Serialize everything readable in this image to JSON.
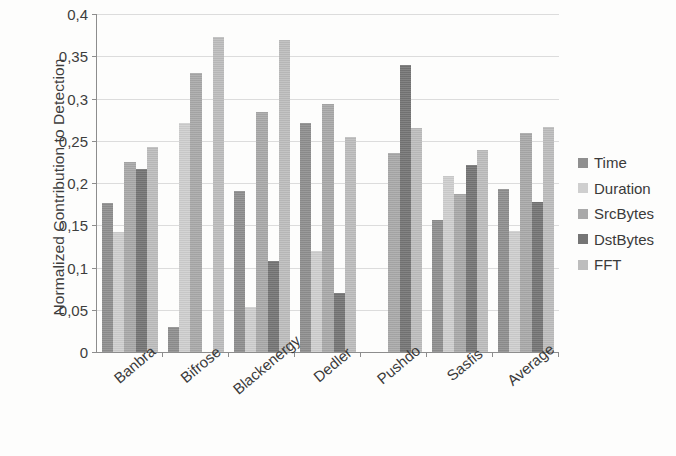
{
  "chart_data": {
    "type": "bar",
    "title": "",
    "xlabel": "",
    "ylabel": "Normalized Contribution to Detection",
    "ylim": [
      0,
      0.4
    ],
    "ytick_values": [
      0,
      0.05,
      0.1,
      0.15,
      0.2,
      0.25,
      0.3,
      0.35,
      0.4
    ],
    "ytick_labels": [
      "0",
      "0,05",
      "0,1",
      "0,15",
      "0,2",
      "0,25",
      "0,3",
      "0,35",
      "0,4"
    ],
    "grid": true,
    "legend_position": "right",
    "decimal_separator": ",",
    "categories": [
      "Banbra",
      "Bifrose",
      "Blackenergy",
      "Dedler",
      "Pushdo",
      "Sasfis",
      "Average"
    ],
    "series": [
      {
        "name": "Time",
        "color": "#8f8f8f",
        "values": [
          0.176,
          0.03,
          0.19,
          0.271,
          0.0,
          0.156,
          0.193
        ]
      },
      {
        "name": "Duration",
        "color": "#cfcfcf",
        "values": [
          0.142,
          0.271,
          0.053,
          0.119,
          0.0,
          0.208,
          0.143
        ]
      },
      {
        "name": "SrcBytes",
        "color": "#a9a9a9",
        "values": [
          0.225,
          0.33,
          0.284,
          0.293,
          0.235,
          0.187,
          0.259
        ]
      },
      {
        "name": "DstBytes",
        "color": "#757575",
        "values": [
          0.217,
          0.0,
          0.108,
          0.07,
          0.34,
          0.221,
          0.177
        ]
      },
      {
        "name": "FFT",
        "color": "#bdbdbd",
        "values": [
          0.243,
          0.373,
          0.369,
          0.254,
          0.265,
          0.239,
          0.266
        ]
      }
    ]
  }
}
